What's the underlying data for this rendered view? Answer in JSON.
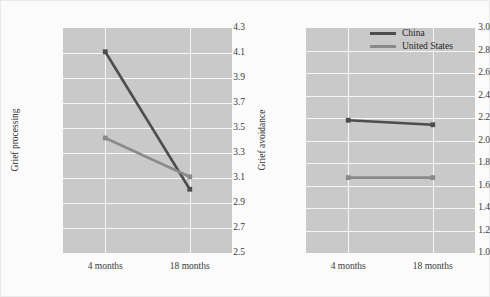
{
  "figure": {
    "background": "#fbfbfb",
    "plot_background": "#c9c9c9",
    "gridline_color": "#f7f7f7"
  },
  "legend": {
    "position": "top-right of right panel",
    "entries": [
      {
        "label": "China",
        "color": "#4d4d4d"
      },
      {
        "label": "United States",
        "color": "#8a8a8a"
      }
    ]
  },
  "chart_data": [
    {
      "type": "line",
      "panel": "left",
      "title": "",
      "xlabel": "",
      "ylabel": "Grief processing",
      "categories": [
        "4 months",
        "18 months"
      ],
      "ylim": [
        2.5,
        4.3
      ],
      "yticks": [
        "2.5",
        "2.7",
        "2.9",
        "3.1",
        "3.3",
        "3.5",
        "3.7",
        "3.9",
        "4.1",
        "4.3"
      ],
      "ytick_values": [
        2.5,
        2.7,
        2.9,
        3.1,
        3.3,
        3.5,
        3.7,
        3.9,
        4.1,
        4.3
      ],
      "grid": true,
      "series": [
        {
          "name": "China",
          "color": "#4d4d4d",
          "values": [
            4.11,
            3.01
          ]
        },
        {
          "name": "United States",
          "color": "#8a8a8a",
          "values": [
            3.42,
            3.11
          ]
        }
      ]
    },
    {
      "type": "line",
      "panel": "right",
      "title": "",
      "xlabel": "",
      "ylabel": "Grief avoidance",
      "categories": [
        "4 months",
        "18 months"
      ],
      "ylim": [
        1.0,
        3.0
      ],
      "yticks": [
        "1.0",
        "1.2",
        "1.4",
        "1.6",
        "1.8",
        "2.0",
        "2.2",
        "2.4",
        "2.6",
        "2.8",
        "3.0"
      ],
      "ytick_values": [
        1.0,
        1.2,
        1.4,
        1.6,
        1.8,
        2.0,
        2.2,
        2.4,
        2.6,
        2.8,
        3.0
      ],
      "grid": true,
      "series": [
        {
          "name": "China",
          "color": "#4d4d4d",
          "values": [
            2.18,
            2.14
          ]
        },
        {
          "name": "United States",
          "color": "#8a8a8a",
          "values": [
            1.67,
            1.67
          ]
        }
      ]
    }
  ]
}
